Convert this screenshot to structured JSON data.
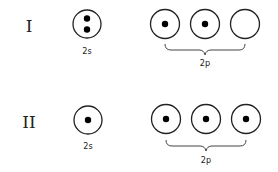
{
  "diagram": {
    "type": "electron-orbital-diagram",
    "rows": [
      {
        "label": "I",
        "s_orbital": {
          "label": "2s",
          "electrons": 2
        },
        "p_orbitals": {
          "label": "2p",
          "electrons": [
            1,
            1,
            0
          ]
        }
      },
      {
        "label": "II",
        "s_orbital": {
          "label": "2s",
          "electrons": 1
        },
        "p_orbitals": {
          "label": "2p",
          "electrons": [
            1,
            1,
            1
          ]
        }
      }
    ]
  },
  "colors": {
    "stroke": "#222222",
    "electron": "#000000",
    "background": "#ffffff"
  }
}
